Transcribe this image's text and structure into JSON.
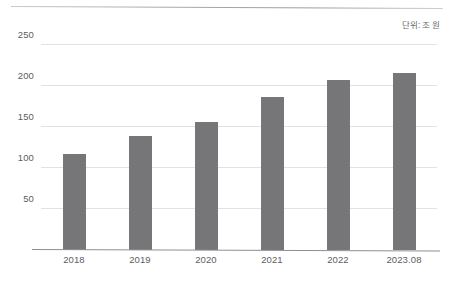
{
  "figure": {
    "unit_note": "단위: 조 원",
    "background_color": "#ffffff",
    "bar_color": "#767678",
    "gridline_color": "#e2e2e4",
    "axis_color": "#8f8f92",
    "text_color": "#5d5d5f"
  },
  "chart_data": {
    "type": "bar",
    "title": "",
    "subtitle": "",
    "xlabel": "",
    "ylabel": "",
    "annotations": [
      "단위: 조 원"
    ],
    "categories": [
      "2018",
      "2019",
      "2020",
      "2021",
      "2022",
      "2023.08"
    ],
    "values": [
      117,
      139,
      156,
      187,
      208,
      216
    ],
    "ylim": [
      0,
      265
    ],
    "yticks": [
      50,
      100,
      150,
      200,
      250
    ],
    "ytick_labels": [
      "50",
      "100",
      "150",
      "200",
      "250"
    ],
    "grid": true,
    "legend": false,
    "legend_position": "none",
    "series": [
      {
        "name": "",
        "values": [
          117,
          139,
          156,
          187,
          208,
          216
        ]
      }
    ]
  }
}
